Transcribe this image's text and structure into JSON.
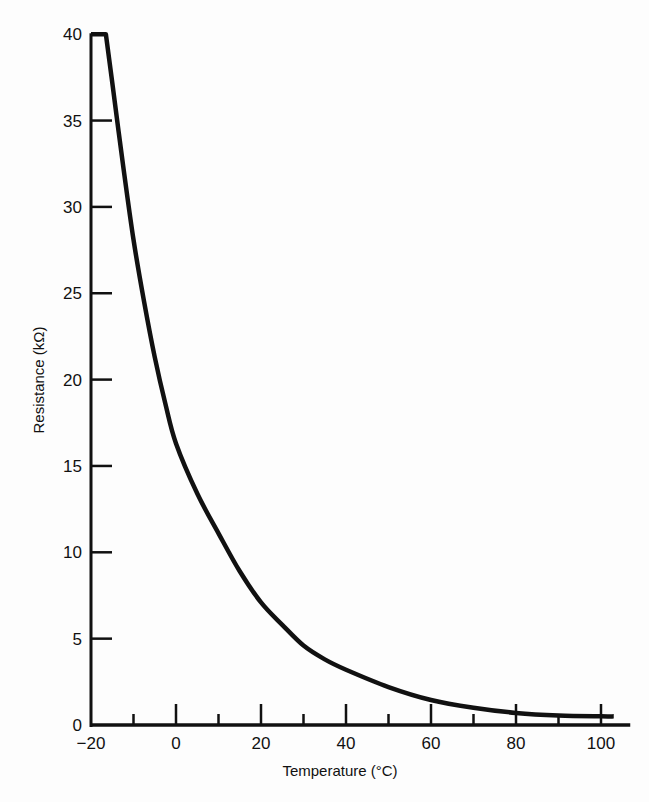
{
  "chart_data": {
    "type": "line",
    "title": "",
    "xlabel": "Temperature (°C)",
    "ylabel": "Resistance (kΩ)",
    "xlim": [
      -20,
      105
    ],
    "ylim": [
      0,
      40
    ],
    "x_ticks_major": [
      -20,
      0,
      20,
      40,
      60,
      80,
      100
    ],
    "x_tick_labels": [
      "−20",
      "0",
      "20",
      "40",
      "60",
      "80",
      "100"
    ],
    "x_ticks_minor": [
      -10,
      10,
      30,
      50,
      70,
      90
    ],
    "y_ticks": [
      0,
      5,
      10,
      15,
      20,
      25,
      30,
      35,
      40
    ],
    "y_tick_labels": [
      "0",
      "5",
      "10",
      "15",
      "20",
      "25",
      "30",
      "35",
      "40"
    ],
    "grid": false,
    "legend": null,
    "series": [
      {
        "name": "Thermistor resistance",
        "color": "#111111",
        "x": [
          -20,
          -16.5,
          -15,
          -12.5,
          -10,
          -7.5,
          -5,
          -2.5,
          0,
          5,
          10,
          15,
          20,
          25,
          30,
          35,
          40,
          50,
          60,
          70,
          80,
          90,
          100,
          103
        ],
        "y": [
          40,
          40,
          37.2,
          32.5,
          28.1,
          24.5,
          21.3,
          18.6,
          16.3,
          13.4,
          11.1,
          8.9,
          7.1,
          5.8,
          4.6,
          3.8,
          3.2,
          2.2,
          1.45,
          1.0,
          0.7,
          0.55,
          0.5,
          0.5
        ]
      }
    ]
  }
}
